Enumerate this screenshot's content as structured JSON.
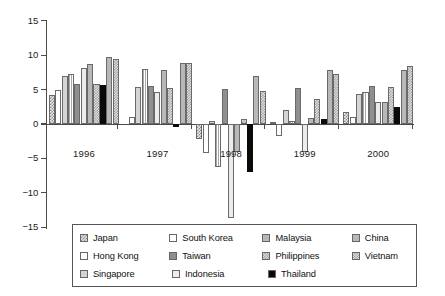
{
  "chart_data": {
    "type": "bar",
    "title": "",
    "xlabel": "",
    "ylabel": "",
    "categories": [
      "1996",
      "1997",
      "1998",
      "1999",
      "2000"
    ],
    "ylim": [
      -15,
      15
    ],
    "yticks": [
      15,
      10,
      5,
      0,
      -5,
      -10,
      -15
    ],
    "ytick_labels": [
      "15",
      "10",
      "5",
      "0",
      "−5",
      "−10",
      "−15"
    ],
    "grid": false,
    "legend_position": "bottom",
    "series": [
      {
        "name": "Japan",
        "fill": "dotgrid",
        "values": [
          4.2,
          0.0,
          -2.2,
          0.3,
          1.8
        ]
      },
      {
        "name": "Hong Kong",
        "fill": "white",
        "values": [
          5.0,
          1.0,
          -4.2,
          -1.7,
          1.0
        ]
      },
      {
        "name": "Singapore",
        "fill": "lgray",
        "values": [
          7.0,
          5.4,
          0.4,
          2.0,
          4.4
        ]
      },
      {
        "name": "South Korea",
        "fill": "vstripe",
        "values": [
          7.2,
          8.0,
          -6.2,
          0.5,
          4.7
        ]
      },
      {
        "name": "Taiwan",
        "fill": "dgray",
        "values": [
          5.8,
          5.5,
          5.1,
          5.3,
          5.5
        ]
      },
      {
        "name": "Indonesia",
        "fill": "vlight",
        "values": [
          8.1,
          4.6,
          -13.6,
          -4.0,
          3.2
        ]
      },
      {
        "name": "Malaysia",
        "fill": "mgray",
        "values": [
          8.7,
          7.9,
          -4.0,
          0.9,
          3.2
        ]
      },
      {
        "name": "Philippines",
        "fill": "checker",
        "values": [
          5.8,
          5.2,
          0.8,
          3.6,
          5.4
        ]
      },
      {
        "name": "Thailand",
        "fill": "black",
        "values": [
          5.7,
          -0.4,
          -7.0,
          0.8,
          2.5
        ]
      },
      {
        "name": "China",
        "fill": "mgray",
        "values": [
          9.8,
          8.8,
          7.0,
          7.9,
          7.9
        ]
      },
      {
        "name": "Vietnam",
        "fill": "checker",
        "values": [
          9.5,
          8.8,
          4.8,
          7.2,
          8.4
        ]
      }
    ]
  },
  "legend": {
    "rows": [
      [
        {
          "label": "Japan",
          "fill": "dotgrid"
        },
        {
          "label": "South Korea",
          "fill": "white"
        },
        {
          "label": "Malaysia",
          "fill": "mgray"
        },
        {
          "label": "China",
          "fill": "mgray"
        }
      ],
      [
        {
          "label": "Hong Kong",
          "fill": "white"
        },
        {
          "label": "Taiwan",
          "fill": "dgray"
        },
        {
          "label": "Philippines",
          "fill": "checker"
        },
        {
          "label": "Vietnam",
          "fill": "checker"
        }
      ],
      [
        {
          "label": "Singapore",
          "fill": "lgray"
        },
        {
          "label": "Indonesia",
          "fill": "vlight"
        },
        {
          "label": "Thailand",
          "fill": "black"
        }
      ]
    ]
  },
  "colors": {
    "axis": "#4a4a4a",
    "text": "#111111",
    "background": "#ffffff",
    "bar_outline": "#6a6a6a"
  }
}
